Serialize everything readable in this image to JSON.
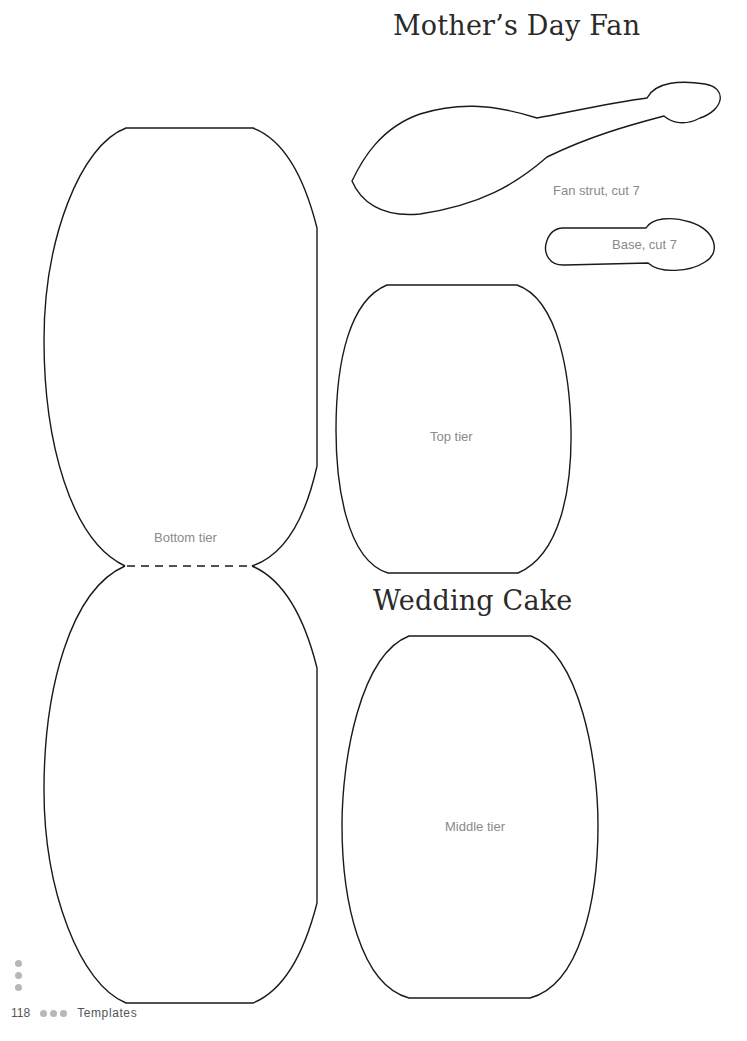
{
  "page": {
    "number": "118",
    "section": "Templates",
    "ink_color": "#1a1a1a",
    "dot_color": "#b8b8b8"
  },
  "mothers_day_fan": {
    "title": "Mother’s Day Fan",
    "pieces": [
      {
        "label": "Fan strut, cut 7"
      },
      {
        "label": "Base, cut 7"
      }
    ]
  },
  "wedding_cake": {
    "title": "Wedding Cake",
    "pieces": [
      {
        "label": "Top tier"
      },
      {
        "label": "Bottom tier"
      },
      {
        "label": "Middle tier"
      }
    ]
  }
}
